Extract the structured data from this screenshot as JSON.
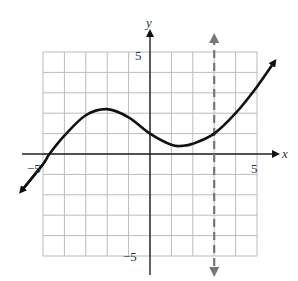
{
  "chart_data": {
    "type": "line",
    "title": "",
    "xlabel": "x",
    "ylabel": "y",
    "xlim": [
      -5,
      5
    ],
    "ylim": [
      -5,
      5
    ],
    "grid": true,
    "tick_labels": {
      "x_neg": "−5",
      "x_pos": "5",
      "y_pos": "5",
      "y_neg": "−5"
    },
    "series": [
      {
        "name": "f(x)",
        "x": [
          -6.0,
          -5.0,
          -4.7,
          -4.0,
          -3.0,
          -2.0,
          -1.0,
          0.0,
          1.0,
          1.5,
          2.0,
          3.0,
          4.0,
          5.0,
          5.8
        ],
        "y": [
          -1.8,
          -0.5,
          0.0,
          0.9,
          1.9,
          2.2,
          1.8,
          1.0,
          0.45,
          0.4,
          0.5,
          1.0,
          2.0,
          3.3,
          4.5
        ]
      }
    ],
    "vertical_asymptote": {
      "x": 3,
      "style": "dashed",
      "color": "#777777"
    },
    "colors": {
      "curve": "#111111",
      "grid": "#bbbbbb",
      "axis": "#222222"
    }
  }
}
